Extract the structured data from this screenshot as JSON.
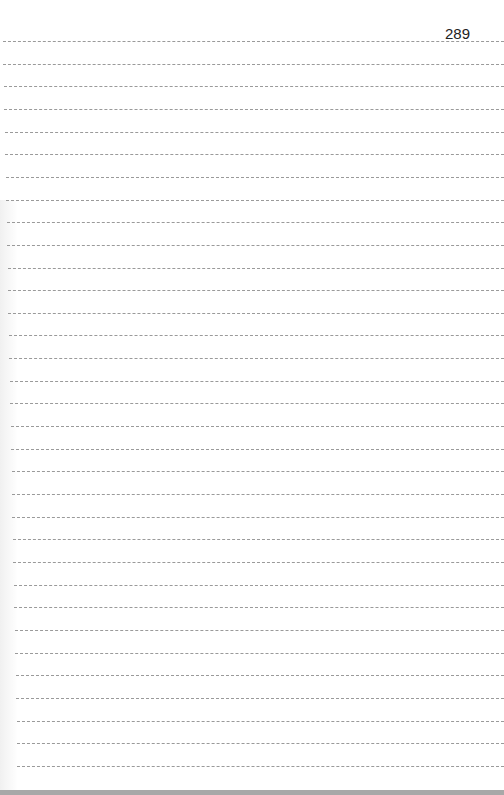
{
  "page": {
    "page_number": "289",
    "ruled_lines": {
      "count": 33,
      "first_y": 41,
      "spacing": 22.65,
      "color": "#9a9a9a"
    }
  }
}
